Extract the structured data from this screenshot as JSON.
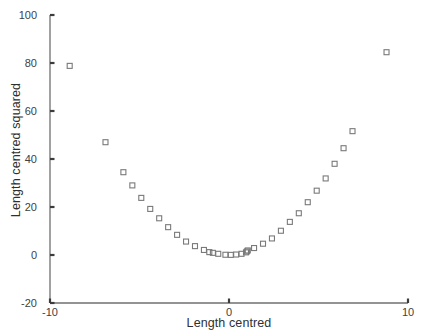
{
  "chart_data": {
    "type": "scatter",
    "title": "",
    "xlabel": "Length centred",
    "ylabel": "Length centred squared",
    "xlim": [
      -10,
      10
    ],
    "ylim": [
      -20,
      100
    ],
    "xticks": [
      -10,
      0,
      10
    ],
    "xtick_labels": [
      "-10",
      "0",
      "10"
    ],
    "yticks": [
      -20,
      0,
      20,
      40,
      60,
      80,
      100
    ],
    "ytick_labels": [
      "-20",
      "0",
      "20",
      "40",
      "60",
      "80",
      "100"
    ],
    "grid": false,
    "legend": "none",
    "marker": "open-square",
    "marker_color": "#7a7a7a",
    "series": [
      {
        "name": "Length centred squared vs Length centred",
        "points": [
          [
            -8.9,
            78.8
          ],
          [
            -6.9,
            47.0
          ],
          [
            -5.9,
            34.5
          ],
          [
            -5.4,
            29.0
          ],
          [
            -4.9,
            23.8
          ],
          [
            -4.4,
            19.2
          ],
          [
            -3.9,
            15.3
          ],
          [
            -3.4,
            11.6
          ],
          [
            -2.9,
            8.4
          ],
          [
            -2.4,
            5.6
          ],
          [
            -1.9,
            3.7
          ],
          [
            -1.4,
            2.1
          ],
          [
            -1.1,
            1.2
          ],
          [
            -0.9,
            0.9
          ],
          [
            -0.6,
            0.5
          ],
          [
            -0.2,
            0.1
          ],
          [
            0.1,
            0.05
          ],
          [
            0.4,
            0.2
          ],
          [
            0.7,
            0.5
          ],
          [
            0.95,
            1.1
          ],
          [
            1.0,
            1.5
          ],
          [
            1.05,
            1.9
          ],
          [
            1.4,
            2.9
          ],
          [
            1.9,
            4.7
          ],
          [
            2.4,
            6.9
          ],
          [
            2.9,
            10.1
          ],
          [
            3.4,
            13.8
          ],
          [
            3.9,
            17.4
          ],
          [
            4.4,
            22.0
          ],
          [
            4.9,
            26.8
          ],
          [
            5.4,
            31.9
          ],
          [
            5.9,
            38.0
          ],
          [
            6.4,
            44.5
          ],
          [
            6.9,
            51.6
          ],
          [
            8.8,
            84.5
          ]
        ]
      }
    ]
  },
  "axes": {
    "y_axis_name": "y-axis",
    "x_axis_name": "x-axis"
  }
}
